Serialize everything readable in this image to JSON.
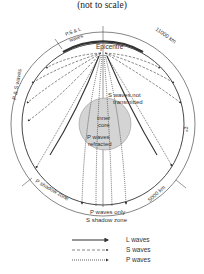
{
  "title": "(not to scale)",
  "diagram": {
    "labels": {
      "epicentre": "Epicentre",
      "ps_l_waves_line1": "P,S & L",
      "ps_l_waves_line2": "waves",
      "distance_top": "11000 km",
      "ps_waves_left": "P & S waves",
      "s_not_transmitted_line1": "S waves not",
      "s_not_transmitted_line2": "transmitted",
      "inner_core_line1": "inner",
      "inner_core_line2": "core",
      "p_refracted_line1": "P waves",
      "p_refracted_line2": "refracted",
      "p_shadow_zone": "P shadow zone",
      "p_waves_only": "P waves only",
      "s_shadow_zone": "S shadow zone",
      "distance_bottom": "5000 km",
      "right_mark": "«3"
    },
    "colors": {
      "line": "#333333",
      "inner_core_fill": "#d4d4d4",
      "background": "#ffffff"
    }
  },
  "legend": {
    "items": [
      {
        "label": "L waves",
        "style": "solid-thick"
      },
      {
        "label": "S waves",
        "style": "dashed"
      },
      {
        "label": "P waves",
        "style": "dotted"
      }
    ]
  }
}
